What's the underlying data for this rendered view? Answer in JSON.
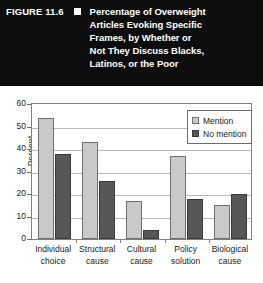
{
  "banner": {
    "figure_number": "FIGURE 11.6",
    "bullet_icon": "white-square-bullet",
    "title_lines": [
      "Percentage of Overweight",
      "Articles Evoking Specific",
      "Frames, by Whether or",
      "Not They Discuss Blacks,",
      "Latinos, or the Poor"
    ],
    "background_color": "#0d0d0d",
    "text_color": "#ffffff"
  },
  "chart_data": {
    "type": "bar",
    "title": "Percentage of Overweight Articles Evoking Specific Frames, by Whether or Not They Discuss Blacks, Latinos, or the Poor",
    "xlabel": "",
    "ylabel": "Percent",
    "ylim": [
      0,
      60
    ],
    "yticks": [
      0,
      10,
      20,
      30,
      40,
      50,
      60
    ],
    "ytick_labels": [
      "0",
      "10",
      "20",
      "30",
      "40",
      "50",
      "60"
    ],
    "grid": true,
    "legend_position": "upper right",
    "categories": [
      "Individual choice",
      "Structural cause",
      "Cultural cause",
      "Policy solution",
      "Biological cause"
    ],
    "category_lines": [
      [
        "Individual",
        "choice"
      ],
      [
        "Structural",
        "cause"
      ],
      [
        "Cultural",
        "cause"
      ],
      [
        "Policy",
        "solution"
      ],
      [
        "Biological",
        "cause"
      ]
    ],
    "series": [
      {
        "name": "Mention",
        "color": "#c9c9c9",
        "values": [
          54,
          43,
          17,
          37,
          15
        ]
      },
      {
        "name": "No mention",
        "color": "#575757",
        "values": [
          38,
          26,
          4,
          18,
          20
        ]
      }
    ]
  }
}
